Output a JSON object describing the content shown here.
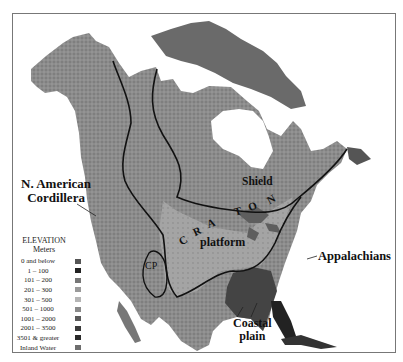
{
  "map": {
    "title": "North America physiographic provinces on elevation map",
    "labels": {
      "cordillera": "N. American Cordillera",
      "cordillera_line1": "N. American",
      "cordillera_line2": "Cordillera",
      "shield": "Shield",
      "craton": "CRATON",
      "craton_letters": [
        "C",
        "R",
        "A",
        "T",
        "O",
        "N"
      ],
      "platform": "platform",
      "appalachians": "Appalachians",
      "coastal_plain_line1": "Coastal",
      "coastal_plain_line2": "plain",
      "cp": "CP"
    }
  },
  "legend": {
    "title": "ELEVATION",
    "unit": "Meters",
    "items": [
      {
        "label": "0 and below",
        "color": "#555555"
      },
      {
        "label": "1 – 100",
        "color": "#222222"
      },
      {
        "label": "101 – 200",
        "color": "#777777"
      },
      {
        "label": "201 – 300",
        "color": "#9a9a9a"
      },
      {
        "label": "301 – 500",
        "color": "#b5b5b5"
      },
      {
        "label": "501 – 1000",
        "color": "#8a8a8a"
      },
      {
        "label": "1001 – 2000",
        "color": "#5a5a5a"
      },
      {
        "label": "2001 – 3500",
        "color": "#3a3a3a"
      },
      {
        "label": "3501 & greater",
        "color": "#2a2a2a"
      },
      {
        "label": "Inland Water",
        "color": "#6e6e6e"
      }
    ]
  }
}
